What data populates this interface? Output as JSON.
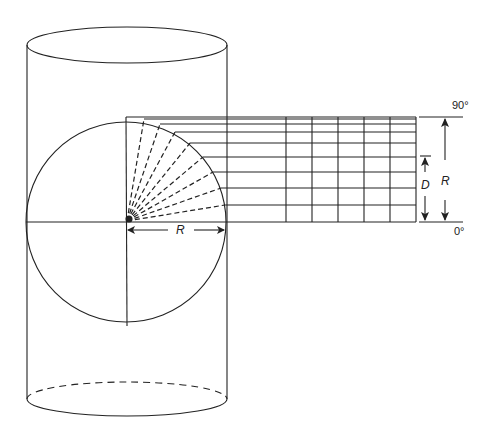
{
  "diagram": {
    "labels": {
      "radius_horizontal": "R",
      "radius_vertical": "R",
      "depth": "D",
      "angle_top": "90°",
      "angle_bottom": "0°"
    },
    "colors": {
      "stroke": "#222222",
      "background": "#ffffff"
    },
    "circle": {
      "cx": 126,
      "cy": 222,
      "r": 100
    },
    "radial_dashed_lines": 10,
    "grid": {
      "vertical_x": [
        286,
        312,
        338,
        364,
        390,
        416
      ],
      "horizontal_y": [
        117,
        119,
        121,
        127,
        134,
        146,
        160,
        177,
        198,
        222
      ]
    }
  }
}
